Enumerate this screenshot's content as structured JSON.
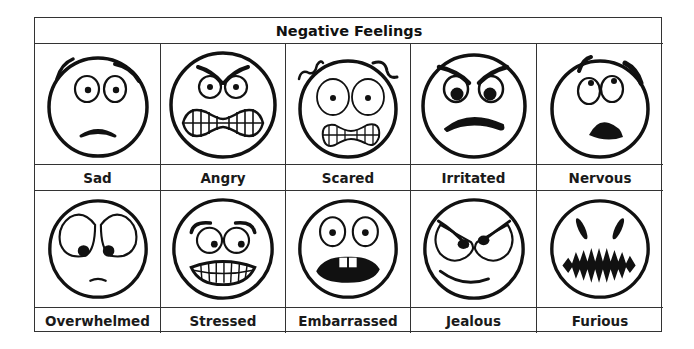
{
  "title": "Negative Feelings",
  "faces": [
    {
      "label": "Sad",
      "icon": "sad-face-icon"
    },
    {
      "label": "Angry",
      "icon": "angry-face-icon"
    },
    {
      "label": "Scared",
      "icon": "scared-face-icon"
    },
    {
      "label": "Irritated",
      "icon": "irritated-face-icon"
    },
    {
      "label": "Nervous",
      "icon": "nervous-face-icon"
    },
    {
      "label": "Overwhelmed",
      "icon": "overwhelmed-face-icon"
    },
    {
      "label": "Stressed",
      "icon": "stressed-face-icon"
    },
    {
      "label": "Embarrassed",
      "icon": "embarrassed-face-icon"
    },
    {
      "label": "Jealous",
      "icon": "jealous-face-icon"
    },
    {
      "label": "Furious",
      "icon": "furious-face-icon"
    }
  ],
  "colors": {
    "line": "#111111",
    "border": "#333333",
    "background": "#ffffff"
  }
}
